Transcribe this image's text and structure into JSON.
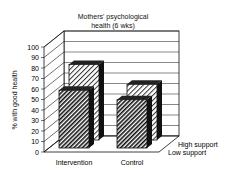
{
  "chart_data": {
    "type": "bar",
    "title": "Mothers' psychological health (6 wks)",
    "title_lines": [
      "Mothers' psychological",
      "health (6 wks)"
    ],
    "xlabel": "",
    "ylabel": "% with good health",
    "ylim": [
      0,
      100
    ],
    "yticks": [
      "0",
      "10",
      "20",
      "30",
      "40",
      "50",
      "60",
      "70",
      "80",
      "90",
      "100"
    ],
    "categories": [
      "Intervention",
      "Control"
    ],
    "series": [
      {
        "name": "Low support",
        "values": [
          55,
          46
        ]
      },
      {
        "name": "High support",
        "values": [
          72,
          53
        ]
      }
    ],
    "grid": true,
    "style": "3d",
    "legend_position": "right, depth axis labels"
  }
}
